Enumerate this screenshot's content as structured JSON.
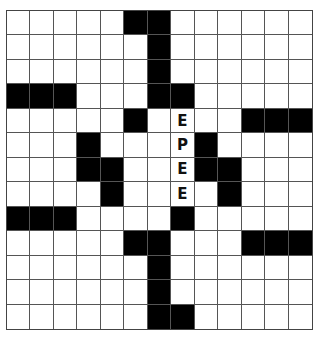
{
  "puzzle": {
    "rows": 13,
    "cols": 13,
    "block_color": "#000000",
    "blocks": [
      [
        0,
        5
      ],
      [
        0,
        6
      ],
      [
        1,
        6
      ],
      [
        2,
        6
      ],
      [
        3,
        0
      ],
      [
        3,
        1
      ],
      [
        3,
        2
      ],
      [
        3,
        6
      ],
      [
        3,
        7
      ],
      [
        4,
        5
      ],
      [
        4,
        10
      ],
      [
        4,
        11
      ],
      [
        4,
        12
      ],
      [
        5,
        3
      ],
      [
        5,
        8
      ],
      [
        6,
        3
      ],
      [
        6,
        4
      ],
      [
        6,
        8
      ],
      [
        6,
        9
      ],
      [
        7,
        4
      ],
      [
        7,
        9
      ],
      [
        8,
        0
      ],
      [
        8,
        1
      ],
      [
        8,
        2
      ],
      [
        8,
        7
      ],
      [
        9,
        5
      ],
      [
        9,
        6
      ],
      [
        9,
        10
      ],
      [
        9,
        11
      ],
      [
        9,
        12
      ],
      [
        10,
        6
      ],
      [
        11,
        6
      ],
      [
        12,
        6
      ],
      [
        12,
        7
      ]
    ],
    "letters": [
      {
        "row": 4,
        "col": 7,
        "char": "E"
      },
      {
        "row": 5,
        "col": 7,
        "char": "P"
      },
      {
        "row": 6,
        "col": 7,
        "char": "E"
      },
      {
        "row": 7,
        "col": 7,
        "char": "E"
      }
    ]
  }
}
